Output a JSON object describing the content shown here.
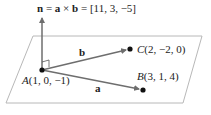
{
  "diagram": {
    "normal_label": {
      "n": "n",
      "eq1": " = ",
      "a": "a",
      "times": " × ",
      "b": "b",
      "eq2": " = ",
      "value": "[11, 3, −5]"
    },
    "vector_b_label": "b",
    "vector_a_label": "a",
    "point_A": {
      "name": "A",
      "coords": "(1, 0, −1)"
    },
    "point_B": {
      "name": "B",
      "coords": "(3, 1, 4)"
    },
    "point_C": {
      "name": "C",
      "coords": "(2, −2, 0)"
    },
    "colors": {
      "plane_edge": "#b8b8b8",
      "vector": "#6e6e6e",
      "point": "#111111",
      "text": "#222222"
    }
  }
}
